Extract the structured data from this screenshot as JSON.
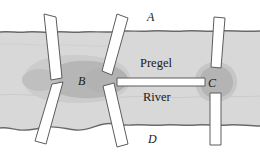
{
  "figure": {
    "labels": {
      "land_north": "A",
      "island_center": "B",
      "land_east": "C",
      "land_south": "D",
      "river_name_line1": "Pregel",
      "river_name_line2": "River"
    },
    "colors": {
      "background": "#ffffff",
      "water": "#d9d9d9",
      "island": "#bdbdbd",
      "island_dark": "#b0b0b0",
      "bank_edge": "#6e6e6e",
      "bridge_fill": "#ffffff",
      "bridge_stroke": "#5a5a5a",
      "label_text": "#1a1a1a"
    },
    "elements": {
      "river_label": "river-water-band",
      "north_bank_label": "north-bank",
      "south_bank_label": "south-bank",
      "island_b_label": "island-b",
      "island_c_label": "landmass-c"
    },
    "bridges": [
      {
        "id": "bridge-1",
        "name": "bridge-a-to-b-west",
        "orientation": "diagonal-right-lean"
      },
      {
        "id": "bridge-2",
        "name": "bridge-b-to-d-west",
        "orientation": "diagonal-left-lean"
      },
      {
        "id": "bridge-3",
        "name": "bridge-a-to-b-east",
        "orientation": "diagonal-right-lean"
      },
      {
        "id": "bridge-4",
        "name": "bridge-b-to-d-east",
        "orientation": "diagonal-right-lean"
      },
      {
        "id": "bridge-5",
        "name": "bridge-b-to-c-center",
        "orientation": "horizontal"
      },
      {
        "id": "bridge-6",
        "name": "bridge-a-to-c",
        "orientation": "near-vertical"
      },
      {
        "id": "bridge-7",
        "name": "bridge-c-to-d",
        "orientation": "vertical"
      }
    ]
  }
}
